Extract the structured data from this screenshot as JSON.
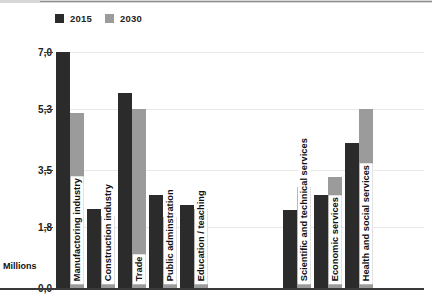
{
  "chart_data": {
    "type": "bar",
    "title": "",
    "subtitle": "",
    "xlabel": "",
    "ylabel": "Millions",
    "ylim": [
      0.0,
      7.0
    ],
    "ytick_labels": [
      "0,0",
      "1,8",
      "3,5",
      "5,3",
      "7,0"
    ],
    "ytick_values": [
      0.0,
      1.8,
      3.5,
      5.3,
      7.0
    ],
    "grid": true,
    "legend_position": "top-left",
    "decimal_separator": ",",
    "categories": [
      "Manufactoring industry",
      "Construction industry",
      "Trade",
      "Public adminstration",
      "Education / teaching",
      "Scientific and technical services",
      "Economic services",
      "Health and social services"
    ],
    "series": [
      {
        "name": "2015",
        "color": "#2b2b2b",
        "values": [
          7.0,
          2.35,
          5.78,
          2.75,
          2.45,
          2.3,
          2.75,
          4.3
        ]
      },
      {
        "name": "2030",
        "color": "#9b9b9b",
        "values": [
          5.2,
          2.15,
          5.32,
          2.1,
          2.35,
          3.0,
          3.3,
          5.3
        ]
      }
    ]
  },
  "legend": {
    "items": [
      {
        "label": "2015",
        "color": "#2b2b2b"
      },
      {
        "label": "2030",
        "color": "#9b9b9b"
      }
    ]
  },
  "axis": {
    "unit_label": "Millions"
  }
}
